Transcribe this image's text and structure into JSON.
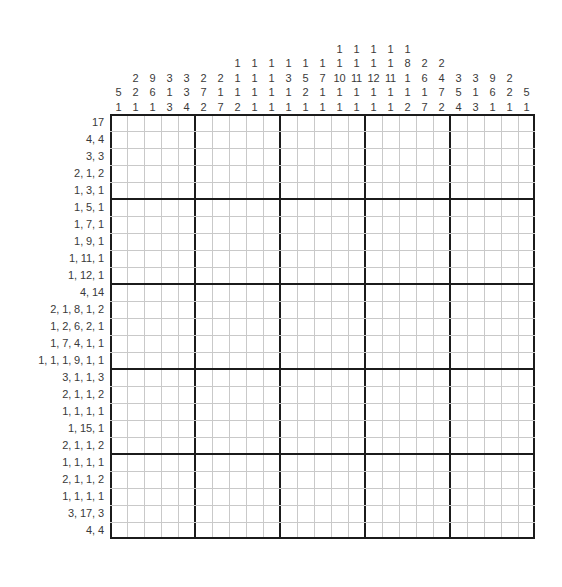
{
  "puzzle": {
    "kind": "nonogram-grid",
    "rows": 25,
    "cols": 25,
    "block_size": 5,
    "cell_px": 17,
    "colors": {
      "grid_minor": "#c9c9c9",
      "grid_major": "#1b1b1b",
      "clue_text": "#3a3a3a",
      "background": "#ffffff"
    },
    "row_clues": [
      "17",
      "4, 4",
      "3, 3",
      "2, 1, 2",
      "1, 3, 1",
      "1, 5, 1",
      "1, 7, 1",
      "1, 9, 1",
      "1, 11, 1",
      "1, 12, 1",
      "4, 14",
      "2, 1, 8, 1, 2",
      "1, 2, 6, 2, 1",
      "1, 7, 4, 1, 1",
      "1, 1, 1, 9, 1, 1",
      "3, 1, 1, 3",
      "2, 1, 1, 2",
      "1, 1, 1, 1",
      "1, 15, 1",
      "2, 1, 1, 2",
      "1, 1, 1, 1",
      "2, 1, 1, 2",
      "1, 1, 1, 1",
      "3, 17, 3",
      "4, 4"
    ],
    "col_clues": [
      [
        "5",
        "1"
      ],
      [
        "2",
        "2",
        "1"
      ],
      [
        "9",
        "6",
        "1"
      ],
      [
        "3",
        "1",
        "3"
      ],
      [
        "3",
        "3",
        "4"
      ],
      [
        "2",
        "7",
        "2"
      ],
      [
        "2",
        "1",
        "7"
      ],
      [
        "1",
        "1",
        "1",
        "2"
      ],
      [
        "1",
        "1",
        "1",
        "1"
      ],
      [
        "1",
        "1",
        "1",
        "1"
      ],
      [
        "1",
        "3",
        "1",
        "1"
      ],
      [
        "1",
        "5",
        "2",
        "1"
      ],
      [
        "1",
        "7",
        "1",
        "1"
      ],
      [
        "1",
        "1",
        "10",
        "1",
        "1"
      ],
      [
        "1",
        "1",
        "11",
        "1",
        "1"
      ],
      [
        "1",
        "1",
        "12",
        "1",
        "1"
      ],
      [
        "1",
        "1",
        "11",
        "1",
        "1"
      ],
      [
        "1",
        "8",
        "1",
        "1",
        "2"
      ],
      [
        "2",
        "6",
        "1",
        "7"
      ],
      [
        "2",
        "4",
        "7",
        "2"
      ],
      [
        "3",
        "5",
        "4"
      ],
      [
        "3",
        "1",
        "3"
      ],
      [
        "9",
        "6",
        "1"
      ],
      [
        "2",
        "2",
        "1"
      ],
      [
        "5",
        "1"
      ]
    ]
  }
}
